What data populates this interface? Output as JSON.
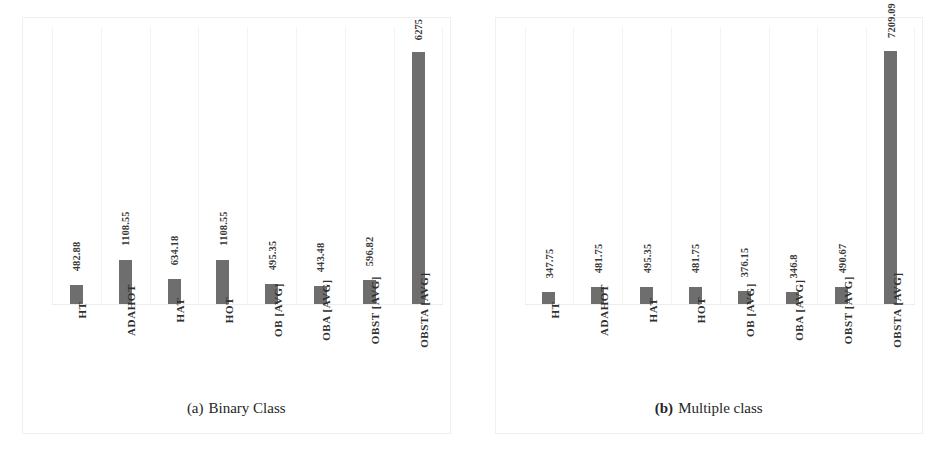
{
  "figure": {
    "background_color": "#ffffff",
    "bar_color": "#6e6e6e",
    "gridline_color": "#f4f4f4"
  },
  "panels": [
    {
      "id": "panel-a",
      "caption_tag": "(a)",
      "caption_text": "Binary Class",
      "caption_tag_bold": false
    },
    {
      "id": "panel-b",
      "caption_tag": "(b)",
      "caption_text": "Multiple class",
      "caption_tag_bold": true
    }
  ],
  "chart_data": [
    {
      "type": "bar",
      "title": "(a) Binary Class",
      "xlabel": "",
      "ylabel": "",
      "grid": true,
      "legend": false,
      "orientation": "vertical",
      "ylim": [
        0,
        6900
      ],
      "categories": [
        "HT",
        "ADAHOT",
        "HAT",
        "HOT",
        "OB [AVG]",
        "OBA [AVG]",
        "OBST [AVG]",
        "OBSTA [AVG]"
      ],
      "values": [
        482.88,
        1108.55,
        634.18,
        1108.55,
        495.35,
        443.48,
        596.82,
        6275
      ],
      "value_labels": [
        "482.88",
        "1108.55",
        "634.18",
        "1108.55",
        "495.35",
        "443.48",
        "596.82",
        "6275"
      ]
    },
    {
      "type": "bar",
      "title": "(b) Multiple class",
      "xlabel": "",
      "ylabel": "",
      "grid": true,
      "legend": false,
      "orientation": "vertical",
      "ylim": [
        0,
        7900
      ],
      "categories": [
        "HT",
        "ADAHOT",
        "HAT",
        "HOT",
        "OB [AVG]",
        "OBA [AVG]",
        "OBST [AVG]",
        "OBSTA [AVG]"
      ],
      "values": [
        347.75,
        481.75,
        495.35,
        481.75,
        376.15,
        346.8,
        490.67,
        7209.09
      ],
      "value_labels": [
        "347.75",
        "481.75",
        "495.35",
        "481.75",
        "376.15",
        "346.8",
        "490.67",
        "7209.09"
      ]
    }
  ]
}
